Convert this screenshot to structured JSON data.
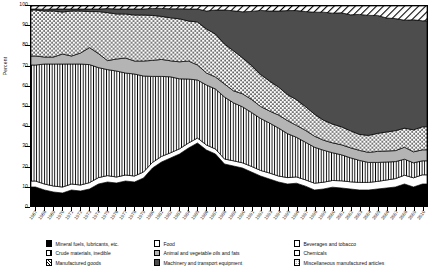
{
  "chart_data": {
    "type": "area",
    "title": "",
    "subtitle": "",
    "xlabel": "",
    "ylabel": "Percent",
    "ylim": [
      0,
      100
    ],
    "yticks": [
      0,
      10,
      20,
      30,
      40,
      50,
      60,
      70,
      80,
      90,
      100
    ],
    "grid": false,
    "stacked": true,
    "normalized_to_percent": true,
    "legend_position": "bottom",
    "x": [
      "1967",
      "1968",
      "1969",
      "1970",
      "1971",
      "1972",
      "1973",
      "1974",
      "1975",
      "1976",
      "1977",
      "1978",
      "1979",
      "1980",
      "1981",
      "1982",
      "1983",
      "1984",
      "1985",
      "1986",
      "1987",
      "1988",
      "1989",
      "1990",
      "1991",
      "1992",
      "1993",
      "1994",
      "1995",
      "1996",
      "1997",
      "1998",
      "1999",
      "2000",
      "2001",
      "2002",
      "2003",
      "2004",
      "2005",
      "2006",
      "2007",
      "2008",
      "2009",
      "2010"
    ],
    "series": [
      {
        "name": "Mineral fuels, lubricants, etc.",
        "pattern": "solid-black",
        "color": "#000000",
        "values": [
          9.5,
          8.0,
          7.0,
          6.5,
          8.0,
          7.5,
          8.5,
          11.0,
          12.0,
          11.5,
          12.5,
          12.0,
          14.0,
          19.0,
          22.0,
          24.0,
          26.0,
          29.0,
          31.5,
          28.0,
          26.0,
          21.0,
          20.0,
          19.0,
          17.0,
          15.0,
          13.5,
          12.0,
          11.0,
          11.5,
          10.0,
          8.0,
          8.5,
          9.5,
          9.0,
          8.5,
          8.0,
          8.0,
          8.5,
          9.0,
          9.5,
          11.0,
          9.5,
          11.0
        ]
      },
      {
        "name": "Food",
        "pattern": "plain-white",
        "color": "#ffffff",
        "values": [
          3.0,
          3.0,
          3.0,
          3.0,
          3.0,
          3.0,
          3.2,
          3.2,
          3.2,
          3.0,
          3.0,
          3.0,
          3.0,
          2.8,
          2.8,
          2.6,
          2.6,
          2.5,
          2.5,
          2.5,
          2.5,
          2.5,
          2.6,
          2.6,
          2.8,
          2.8,
          3.0,
          3.0,
          3.2,
          3.2,
          3.2,
          3.4,
          3.4,
          3.4,
          3.6,
          3.6,
          3.8,
          3.8,
          3.8,
          4.0,
          4.2,
          4.4,
          4.6,
          4.6
        ]
      },
      {
        "name": "Crude materials, inedible",
        "pattern": "vertical-lines",
        "color": "#ffffff",
        "values": [
          58.0,
          60.0,
          61.0,
          61.5,
          60.0,
          60.5,
          59.0,
          55.0,
          53.0,
          53.0,
          51.0,
          51.0,
          48.0,
          43.0,
          40.0,
          38.0,
          35.0,
          32.0,
          29.0,
          30.0,
          30.0,
          31.0,
          29.0,
          28.0,
          27.0,
          26.0,
          25.0,
          24.0,
          22.0,
          20.0,
          19.0,
          18.0,
          16.0,
          14.0,
          13.0,
          12.0,
          11.0,
          10.0,
          9.5,
          9.0,
          8.5,
          8.0,
          7.5,
          7.0
        ]
      },
      {
        "name": "Animal and vegetable oils and fats",
        "pattern": "gray",
        "color": "#b4b4b4",
        "values": [
          4.5,
          3.5,
          3.5,
          5.0,
          4.0,
          5.5,
          8.5,
          7.0,
          4.5,
          6.0,
          7.5,
          6.5,
          7.5,
          8.0,
          8.5,
          8.0,
          8.5,
          9.0,
          7.5,
          6.0,
          6.0,
          6.5,
          6.0,
          6.5,
          6.5,
          6.0,
          6.0,
          6.5,
          6.5,
          6.0,
          6.0,
          5.5,
          5.0,
          5.0,
          5.0,
          5.0,
          5.0,
          5.0,
          5.5,
          5.5,
          5.5,
          6.0,
          5.5,
          5.5
        ]
      },
      {
        "name": "Miscellaneous manufactured articles",
        "pattern": "dots",
        "color": "#ffffff",
        "values": [
          23.0,
          23.0,
          23.0,
          21.0,
          22.5,
          21.0,
          18.0,
          21.0,
          24.0,
          22.5,
          22.0,
          23.0,
          23.0,
          22.5,
          21.5,
          21.5,
          21.5,
          20.0,
          21.5,
          22.0,
          21.5,
          20.0,
          20.0,
          18.0,
          17.0,
          16.0,
          15.0,
          14.0,
          13.0,
          13.0,
          12.0,
          11.0,
          10.0,
          9.5,
          9.0,
          8.5,
          8.0,
          8.5,
          9.0,
          9.5,
          10.0,
          9.5,
          11.0,
          11.5
        ]
      },
      {
        "name": "Machinery and transport equipment",
        "pattern": "dark-gray",
        "color": "#4d4d4d",
        "values": [
          0.5,
          0.8,
          1.0,
          1.5,
          1.0,
          1.0,
          1.3,
          1.3,
          2.0,
          2.5,
          2.5,
          3.0,
          3.0,
          3.5,
          4.0,
          4.5,
          5.0,
          6.0,
          6.5,
          9.0,
          12.0,
          17.0,
          20.0,
          23.0,
          27.0,
          32.0,
          35.0,
          38.0,
          42.0,
          45.0,
          48.0,
          51.0,
          54.0,
          56.0,
          57.0,
          58.0,
          60.0,
          60.0,
          59.0,
          57.0,
          56.0,
          54.0,
          55.0,
          53.0
        ]
      },
      {
        "name": "Manufactured goods",
        "pattern": "diagonal-hatch",
        "color": "#ffffff",
        "values": [
          1.5,
          1.7,
          1.5,
          1.5,
          1.5,
          1.5,
          1.5,
          1.5,
          1.3,
          1.5,
          1.5,
          1.5,
          1.5,
          1.2,
          1.2,
          1.4,
          1.4,
          1.5,
          1.5,
          2.5,
          2.0,
          2.0,
          2.4,
          2.9,
          2.7,
          2.2,
          2.5,
          2.5,
          2.3,
          2.3,
          2.8,
          3.1,
          3.1,
          3.6,
          3.4,
          4.4,
          4.2,
          4.7,
          4.7,
          6.0,
          6.3,
          7.1,
          6.9,
          7.4
        ]
      }
    ]
  },
  "axes": {
    "ylabel": "Percent",
    "yticks": [
      "0",
      "10",
      "20",
      "30",
      "40",
      "50",
      "60",
      "70",
      "80",
      "90",
      "100"
    ]
  },
  "legend": {
    "columns": [
      {
        "items": [
          {
            "label": "Mineral fuels, lubricants, etc.",
            "pattern": "solid-black"
          },
          {
            "label": "Crude materials, inedible",
            "pattern": "vertical-lines"
          },
          {
            "label": "Manufactured goods",
            "pattern": "diagonal-hatch"
          }
        ]
      },
      {
        "items": [
          {
            "label": "Food",
            "pattern": "plain-white"
          },
          {
            "label": "Animal and vegetable oils and fats",
            "pattern": "gray"
          },
          {
            "label": "Machinery and transport equipment",
            "pattern": "dark-gray"
          }
        ]
      },
      {
        "items": [
          {
            "label": "Beverages and tobacco",
            "pattern": "plain-white"
          },
          {
            "label": "Chemicals",
            "pattern": "plain-white"
          },
          {
            "label": "Miscellaneous manufactured articles",
            "pattern": "dots"
          }
        ]
      }
    ]
  }
}
